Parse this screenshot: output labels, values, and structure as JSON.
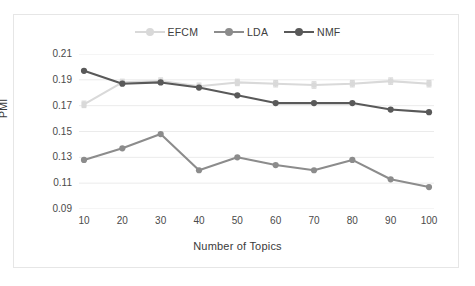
{
  "chart_data": {
    "type": "line",
    "title": "",
    "xlabel": "Number of Topics",
    "ylabel": "PMI",
    "x": [
      10,
      20,
      30,
      40,
      50,
      60,
      70,
      80,
      90,
      100
    ],
    "xticklabels": [
      "10",
      "20",
      "30",
      "40",
      "50",
      "60",
      "70",
      "80",
      "90",
      "100"
    ],
    "yticklabels": [
      "0.21",
      "0.19",
      "0.17",
      "0.15",
      "0.13",
      "0.11",
      "0.09"
    ],
    "yticks": [
      0.21,
      0.19,
      0.17,
      0.15,
      0.13,
      0.11,
      0.09
    ],
    "ylim": [
      0.09,
      0.21
    ],
    "xlim": [
      10,
      100
    ],
    "grid": true,
    "grid_axis": "y",
    "legend_position": "top-center",
    "series": [
      {
        "name": "EFCM",
        "color": "#d9d9d9",
        "marker": "square",
        "has_error_bars": true,
        "values": [
          0.171,
          0.188,
          0.189,
          0.185,
          0.188,
          0.187,
          0.186,
          0.187,
          0.189,
          0.187
        ]
      },
      {
        "name": "LDA",
        "color": "#8c8c8c",
        "marker": "circle",
        "has_error_bars": false,
        "values": [
          0.128,
          0.137,
          0.148,
          0.12,
          0.13,
          0.124,
          0.12,
          0.128,
          0.113,
          0.107
        ]
      },
      {
        "name": "NMF",
        "color": "#595959",
        "marker": "circle",
        "has_error_bars": false,
        "values": [
          0.197,
          0.187,
          0.188,
          0.184,
          0.178,
          0.172,
          0.172,
          0.172,
          0.167,
          0.165
        ]
      }
    ]
  },
  "legend": {
    "items": [
      {
        "label": "EFCM"
      },
      {
        "label": "LDA"
      },
      {
        "label": "NMF"
      }
    ]
  },
  "axes": {
    "y_title": "PMI",
    "x_title": "Number of Topics"
  }
}
